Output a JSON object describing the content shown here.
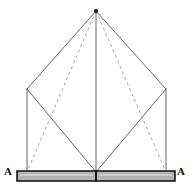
{
  "figure": {
    "type": "line-diagram",
    "background_color": "#ffffff"
  },
  "labels": {
    "section_left": "A",
    "section_right": "A"
  },
  "colors": {
    "solid_line": "#555555",
    "dashed_line": "#999999",
    "base_bar_fill": "#b3b3b3",
    "base_bar_highlight": "#cccccc",
    "base_bar_border": "#1a1a1a",
    "apex_marker": "#1a1a1a",
    "label_text": "#111111"
  },
  "geometry": {
    "apex": {
      "x": 96,
      "y": 11
    },
    "eave_left": {
      "x": 27,
      "y": 89
    },
    "eave_right": {
      "x": 166,
      "y": 89
    },
    "base_left": {
      "x": 27,
      "y": 172
    },
    "base_right": {
      "x": 166,
      "y": 172
    },
    "base_center": {
      "x": 96,
      "y": 172
    }
  },
  "base_bar": {
    "x": 17,
    "y": 171,
    "width": 158,
    "height": 10,
    "split_at_x": 96
  },
  "line_styles": {
    "solid_width": 0.9,
    "dashed_width": 0.9,
    "dash_pattern": "3 3"
  }
}
